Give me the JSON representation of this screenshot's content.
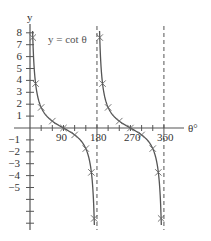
{
  "chart_data": {
    "type": "line",
    "title": "y = cot θ",
    "xlabel": "θ°",
    "ylabel": "y",
    "xlim": [
      0,
      360
    ],
    "ylim": [
      -8,
      8
    ],
    "x_ticks": [
      90,
      180,
      270,
      360
    ],
    "x_minor_ticks": [
      30,
      60,
      90,
      120,
      150,
      180,
      210,
      240,
      270,
      300,
      330,
      360
    ],
    "y_ticks": [
      8,
      7,
      6,
      5,
      4,
      3,
      2,
      1,
      -1,
      -2,
      -3,
      -4,
      -5,
      -6,
      -7,
      -8
    ],
    "y_tick_labels": [
      "8",
      "7",
      "6",
      "5",
      "4",
      "3",
      "2",
      "1",
      "−1",
      "−2",
      "−3",
      "−4",
      "−5"
    ],
    "asymptotes": [
      180,
      360
    ],
    "grid": false,
    "series": [
      {
        "name": "y = cot θ",
        "marker": "x",
        "x": [
          7.5,
          15,
          30,
          60,
          90,
          120,
          150,
          165,
          172.5,
          187.5,
          195,
          210,
          240,
          270,
          300,
          330,
          345,
          352.5
        ],
        "y": [
          7.6,
          3.73,
          1.73,
          0.58,
          0,
          -0.58,
          -1.73,
          -3.73,
          -7.6,
          7.6,
          3.73,
          1.73,
          0.58,
          0,
          -0.58,
          -1.73,
          -3.73,
          -7.6
        ]
      }
    ]
  },
  "labels": {
    "y_axis": "y",
    "x_axis": "θ°",
    "equation": "y = cot θ",
    "x90": "90",
    "x180": "180",
    "x270": "270",
    "x360": "360"
  }
}
